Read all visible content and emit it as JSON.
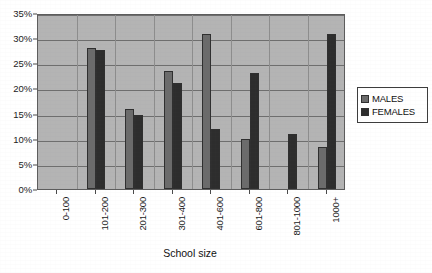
{
  "chart_data": {
    "type": "bar",
    "title": "",
    "xlabel": "School size",
    "ylabel": "",
    "ylim": [
      0,
      35
    ],
    "ytick_labels": [
      "0%",
      "5%",
      "10%",
      "15%",
      "20%",
      "25%",
      "30%",
      "35%"
    ],
    "ytick_values": [
      0,
      5,
      10,
      15,
      20,
      25,
      30,
      35
    ],
    "grid": true,
    "legend_position": "right",
    "categories": [
      "0-100",
      "101-200",
      "201-300",
      "301-400",
      "401-600",
      "601-800",
      "801-1000",
      "1000+"
    ],
    "series": [
      {
        "name": "MALES",
        "color": "#6b6b6b",
        "values": [
          0,
          28.0,
          16.0,
          23.4,
          30.9,
          10.0,
          0,
          8.3
        ]
      },
      {
        "name": "FEMALES",
        "color": "#2d2d2d",
        "values": [
          0,
          27.7,
          14.8,
          21.0,
          11.9,
          23.0,
          11.0,
          30.9
        ]
      }
    ]
  },
  "legend": {
    "items": [
      {
        "label": "MALES",
        "swatch": "males-swatch-icon"
      },
      {
        "label": "FEMALES",
        "swatch": "females-swatch-icon"
      }
    ]
  },
  "axis": {
    "x_title": "School size"
  }
}
